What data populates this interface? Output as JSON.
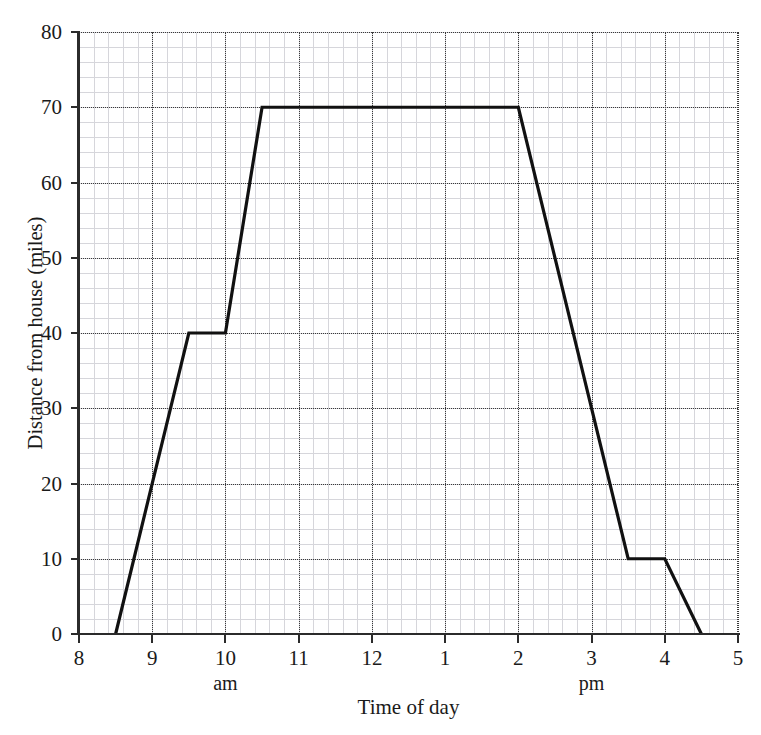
{
  "chart_data": {
    "type": "line",
    "title": "",
    "xlabel": "Time of day",
    "ylabel": "Distance from house (miles)",
    "xlim": [
      8,
      17
    ],
    "ylim": [
      0,
      80
    ],
    "grid": true,
    "legend": "none",
    "x_tick_labels": [
      "8",
      "9",
      "10",
      "11",
      "12",
      "1",
      "2",
      "3",
      "4",
      "5"
    ],
    "x_tick_values": [
      8,
      9,
      10,
      11,
      12,
      13,
      14,
      15,
      16,
      17
    ],
    "x_sublabels": [
      {
        "label": "am",
        "at": 10
      },
      {
        "label": "pm",
        "at": 15
      }
    ],
    "y_tick_labels": [
      "0",
      "10",
      "20",
      "30",
      "40",
      "50",
      "60",
      "70",
      "80"
    ],
    "y_tick_values": [
      0,
      10,
      20,
      30,
      40,
      50,
      60,
      70,
      80
    ],
    "minor_ticks_per_major_x": 5,
    "minor_ticks_per_major_y": 5,
    "series": [
      {
        "name": "Distance from house",
        "color": "#111111",
        "line_width": 3.2,
        "x": [
          8.5,
          9.5,
          10.0,
          10.5,
          14.0,
          15.5,
          16.0,
          16.5
        ],
        "y": [
          0,
          40,
          40,
          70,
          70,
          10,
          10,
          0
        ],
        "points": [
          {
            "time_label": "8:30 am",
            "x": 8.5,
            "y": 0
          },
          {
            "time_label": "9:30 am",
            "x": 9.5,
            "y": 40
          },
          {
            "time_label": "10:00 am",
            "x": 10.0,
            "y": 40
          },
          {
            "time_label": "10:30 am",
            "x": 10.5,
            "y": 70
          },
          {
            "time_label": "2:00 pm",
            "x": 14.0,
            "y": 70
          },
          {
            "time_label": "3:30 pm",
            "x": 15.5,
            "y": 10
          },
          {
            "time_label": "4:00 pm",
            "x": 16.0,
            "y": 10
          },
          {
            "time_label": "4:30 pm",
            "x": 16.5,
            "y": 0
          }
        ]
      }
    ]
  },
  "colors": {
    "line": "#111111",
    "axis": "#2b2b2b",
    "major_grid": "#3a3a3a",
    "minor_grid": "#c9c9cf",
    "background": "#ffffff",
    "text": "#1a1a1a"
  }
}
